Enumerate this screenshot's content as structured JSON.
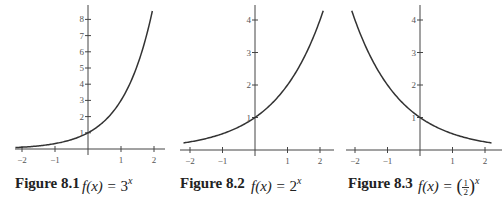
{
  "figures": [
    {
      "label": "Figure 8.1",
      "formula_prefix": "f(x) = ",
      "base": "3",
      "exponent": "x"
    },
    {
      "label": "Figure 8.2",
      "formula_prefix": "f(x) = ",
      "base": "2",
      "exponent": "x"
    },
    {
      "label": "Figure 8.3",
      "formula_prefix": "f(x) = ",
      "frac_num": "1",
      "frac_den": "2",
      "paren_open": "(",
      "paren_close": ")",
      "exponent": "x"
    }
  ],
  "chart_data": [
    {
      "type": "line",
      "title": "Figure 8.1  f(x) = 3^x",
      "function": "3^x",
      "x": [
        -2.2,
        -2,
        -1.5,
        -1,
        -0.5,
        0,
        0.5,
        1,
        1.5,
        1.95
      ],
      "y": [
        0.089,
        0.111,
        0.192,
        0.333,
        0.577,
        1,
        1.732,
        3,
        5.196,
        8.51
      ],
      "xticks": [
        "-2",
        "-1",
        "1",
        "2"
      ],
      "yticks": [
        "1",
        "2",
        "3",
        "4",
        "5",
        "6",
        "7",
        "8"
      ],
      "xlim": [
        -2.2,
        2.2
      ],
      "ylim": [
        0,
        8.5
      ],
      "grid": false,
      "legend": null
    },
    {
      "type": "line",
      "title": "Figure 8.2  f(x) = 2^x",
      "function": "2^x",
      "x": [
        -2.2,
        -2,
        -1.5,
        -1,
        -0.5,
        0,
        0.5,
        1,
        1.5,
        2,
        2.1
      ],
      "y": [
        0.218,
        0.25,
        0.354,
        0.5,
        0.707,
        1,
        1.414,
        2,
        2.828,
        4,
        4.29
      ],
      "xticks": [
        "-2",
        "-1",
        "1",
        "2"
      ],
      "yticks": [
        "1",
        "2",
        "3",
        "4"
      ],
      "xlim": [
        -2.2,
        2.2
      ],
      "ylim": [
        0,
        4.3
      ],
      "grid": false,
      "legend": null
    },
    {
      "type": "line",
      "title": "Figure 8.3  f(x) = (1/2)^x",
      "function": "(1/2)^x",
      "x": [
        -2.1,
        -2,
        -1.5,
        -1,
        -0.5,
        0,
        0.5,
        1,
        1.5,
        2,
        2.2
      ],
      "y": [
        4.29,
        4,
        2.828,
        2,
        1.414,
        1,
        0.707,
        0.5,
        0.354,
        0.25,
        0.218
      ],
      "xticks": [
        "-2",
        "-1",
        "1",
        "2"
      ],
      "yticks": [
        "1",
        "2",
        "3",
        "4"
      ],
      "xlim": [
        -2.2,
        2.2
      ],
      "ylim": [
        0,
        4.3
      ],
      "grid": false,
      "legend": null
    }
  ]
}
